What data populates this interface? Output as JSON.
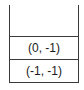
{
  "stack": {
    "items": [
      {
        "label": "(0, -1)"
      },
      {
        "label": "(-1, -1)"
      }
    ]
  }
}
